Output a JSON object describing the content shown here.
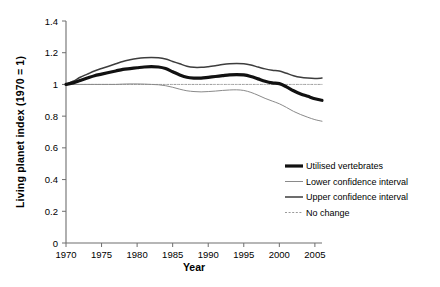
{
  "chart_data": {
    "type": "line",
    "title": "",
    "xlabel": "Year",
    "ylabel": "Living planet index (1970 = 1)",
    "xlim": [
      1970,
      2006
    ],
    "ylim": [
      0,
      1.4
    ],
    "xticks": [
      1970,
      1975,
      1980,
      1985,
      1990,
      1995,
      2000,
      2005
    ],
    "yticks": [
      0,
      0.2,
      0.4,
      0.6,
      0.8,
      1,
      1.2,
      1.4
    ],
    "ytick_labels": [
      "0",
      "0.2",
      "0.4",
      "0.6",
      "0.8",
      "1",
      "1.2",
      "1.4"
    ],
    "xtick_labels": [
      "1970",
      "1975",
      "1980",
      "1985",
      "1990",
      "1995",
      "2000",
      "2005"
    ],
    "grid": false,
    "legend_position": "right-center",
    "x": [
      1970,
      1971,
      1972,
      1973,
      1974,
      1975,
      1976,
      1977,
      1978,
      1979,
      1980,
      1981,
      1982,
      1983,
      1984,
      1985,
      1986,
      1987,
      1988,
      1989,
      1990,
      1991,
      1992,
      1993,
      1994,
      1995,
      1996,
      1997,
      1998,
      1999,
      2000,
      2001,
      2002,
      2003,
      2004,
      2005,
      2006
    ],
    "series": [
      {
        "name": "Utilised vertebrates",
        "style": "thick-solid-black",
        "color": "#111111",
        "values": [
          1.0,
          1.01,
          1.025,
          1.04,
          1.055,
          1.065,
          1.075,
          1.085,
          1.095,
          1.1,
          1.105,
          1.11,
          1.112,
          1.11,
          1.1,
          1.08,
          1.06,
          1.045,
          1.04,
          1.04,
          1.045,
          1.05,
          1.055,
          1.06,
          1.062,
          1.06,
          1.05,
          1.035,
          1.02,
          1.01,
          1.005,
          0.985,
          0.96,
          0.94,
          0.925,
          0.91,
          0.9
        ]
      },
      {
        "name": "Upper confidence interval",
        "style": "medium-solid-gray",
        "color": "#3d3d3d",
        "values": [
          1.0,
          1.02,
          1.045,
          1.065,
          1.085,
          1.1,
          1.115,
          1.13,
          1.145,
          1.155,
          1.163,
          1.168,
          1.17,
          1.168,
          1.16,
          1.145,
          1.13,
          1.115,
          1.108,
          1.108,
          1.112,
          1.118,
          1.125,
          1.13,
          1.132,
          1.13,
          1.122,
          1.11,
          1.098,
          1.09,
          1.085,
          1.07,
          1.055,
          1.045,
          1.04,
          1.038,
          1.04
        ]
      },
      {
        "name": "Lower confidence interval",
        "style": "thin-solid-gray",
        "color": "#8a8a8a",
        "values": [
          1.0,
          1.0,
          1.0,
          1.0,
          1.0,
          1.0,
          1.0,
          1.0,
          1.002,
          1.003,
          1.003,
          1.002,
          1.0,
          0.998,
          0.992,
          0.982,
          0.97,
          0.96,
          0.955,
          0.953,
          0.955,
          0.958,
          0.962,
          0.965,
          0.966,
          0.962,
          0.95,
          0.932,
          0.912,
          0.895,
          0.878,
          0.855,
          0.83,
          0.81,
          0.793,
          0.778,
          0.768
        ]
      },
      {
        "name": "No change",
        "style": "dashed-gray",
        "color": "#9a9a9a",
        "values": [
          1,
          1,
          1,
          1,
          1,
          1,
          1,
          1,
          1,
          1,
          1,
          1,
          1,
          1,
          1,
          1,
          1,
          1,
          1,
          1,
          1,
          1,
          1,
          1,
          1,
          1,
          1,
          1,
          1,
          1,
          1,
          1,
          1,
          1,
          1,
          1,
          1
        ]
      }
    ],
    "legend": [
      {
        "label": "Utilised vertebrates",
        "style": "thick-solid-black",
        "color": "#111111"
      },
      {
        "label": "Lower confidence interval",
        "style": "thin-solid-gray",
        "color": "#8a8a8a"
      },
      {
        "label": "Upper confidence interval",
        "style": "medium-solid-gray",
        "color": "#3d3d3d"
      },
      {
        "label": "No change",
        "style": "dashed-gray",
        "color": "#9a9a9a"
      }
    ]
  }
}
